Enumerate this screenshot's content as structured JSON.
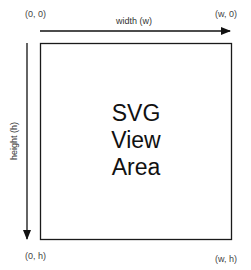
{
  "diagram": {
    "corners": {
      "top_left": "(0, 0)",
      "top_right": "(w, 0)",
      "bottom_left": "(0, h)",
      "bottom_right": "(w, h)"
    },
    "axes": {
      "width_label": "width (w)",
      "height_label": "height (h)"
    },
    "view_area": {
      "line1": "SVG",
      "line2": "View",
      "line3": "Area"
    },
    "colors": {
      "stroke": "#1a1a1a",
      "arrow": "#111111",
      "text": "#444444"
    }
  }
}
